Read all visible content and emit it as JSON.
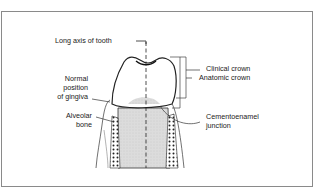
{
  "diagram": {
    "labels": {
      "long_axis": "Long axis of tooth",
      "clinical_crown": "Clinical crown",
      "anatomic_crown": "Anatomic crown",
      "gingiva_line1": "Normal",
      "gingiva_line2": "position",
      "gingiva_line3": "of gingiva",
      "alveolar_line1": "Alveolar",
      "alveolar_line2": "bone",
      "cej_line1": "Cementoenamel",
      "cej_line2": "junction"
    },
    "colors": {
      "line": "#222222",
      "root_fill": "#d9d9d9",
      "frame": "#8a8a8a"
    }
  }
}
